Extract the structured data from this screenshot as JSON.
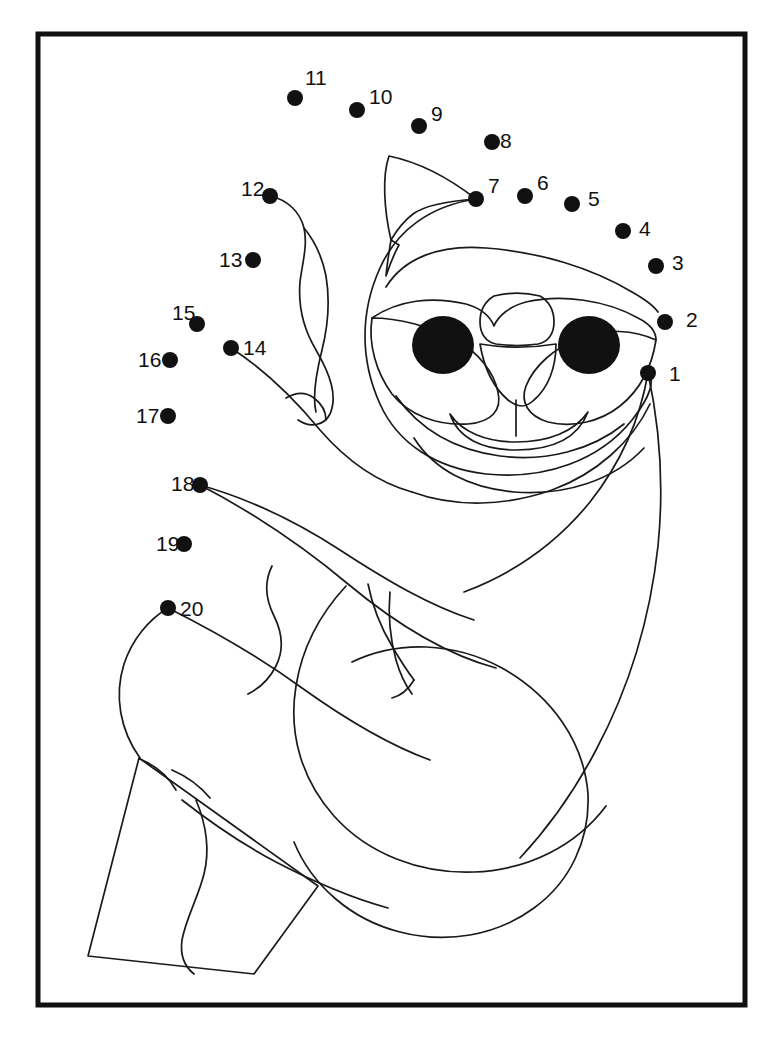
{
  "page": {
    "background_color": "#ffffff",
    "ink_color": "#111111",
    "width": 761,
    "height": 1059
  },
  "frame": {
    "name": "page-border",
    "x": 38,
    "y": 34,
    "width": 707,
    "height": 971,
    "stroke_color": "#111111",
    "stroke_width": 5
  },
  "puzzle": {
    "type": "dot-to-dot",
    "subject": "sloth hanging on a branch",
    "dot_count": 20,
    "dot_radius": 8,
    "label_font_size": 21,
    "dots": [
      {
        "number": "1",
        "x": 648,
        "y": 373,
        "label_x": 669,
        "label_y": 381
      },
      {
        "number": "2",
        "x": 665,
        "y": 322,
        "label_x": 686,
        "label_y": 327
      },
      {
        "number": "3",
        "x": 656,
        "y": 266,
        "label_x": 672,
        "label_y": 270
      },
      {
        "number": "4",
        "x": 623,
        "y": 231,
        "label_x": 639,
        "label_y": 236
      },
      {
        "number": "5",
        "x": 572,
        "y": 204,
        "label_x": 588,
        "label_y": 206
      },
      {
        "number": "6",
        "x": 525,
        "y": 196,
        "label_x": 537,
        "label_y": 190
      },
      {
        "number": "7",
        "x": 476,
        "y": 199,
        "label_x": 488,
        "label_y": 193
      },
      {
        "number": "8",
        "x": 492,
        "y": 142,
        "label_x": 500,
        "label_y": 148
      },
      {
        "number": "9",
        "x": 419,
        "y": 126,
        "label_x": 431,
        "label_y": 121
      },
      {
        "number": "10",
        "x": 357,
        "y": 110,
        "label_x": 369,
        "label_y": 104
      },
      {
        "number": "11",
        "x": 295,
        "y": 98,
        "label_x": 305,
        "label_y": 85
      },
      {
        "number": "12",
        "x": 270,
        "y": 196,
        "label_x": 241,
        "label_y": 196
      },
      {
        "number": "13",
        "x": 253,
        "y": 260,
        "label_x": 219,
        "label_y": 267
      },
      {
        "number": "14",
        "x": 231,
        "y": 348,
        "label_x": 243,
        "label_y": 355
      },
      {
        "number": "15",
        "x": 197,
        "y": 324,
        "label_x": 172,
        "label_y": 320
      },
      {
        "number": "16",
        "x": 170,
        "y": 360,
        "label_x": 138,
        "label_y": 367
      },
      {
        "number": "17",
        "x": 168,
        "y": 416,
        "label_x": 136,
        "label_y": 423
      },
      {
        "number": "18",
        "x": 200,
        "y": 485,
        "label_x": 171,
        "label_y": 491
      },
      {
        "number": "19",
        "x": 184,
        "y": 544,
        "label_x": 156,
        "label_y": 551
      },
      {
        "number": "20",
        "x": 168,
        "y": 608,
        "label_x": 180,
        "label_y": 616
      }
    ]
  },
  "artwork": {
    "description": "Line-art sloth hugging a tree branch",
    "parts": [
      {
        "name": "ear-left",
        "path": "M 389 156 C 382 176 384 210 391 240 C 398 228 405 220 413 214 C 424 206 448 201 476 199 C 449 178 418 162 389 156 Z"
      },
      {
        "name": "ear-inner-notch",
        "path": "M 391 240 C 389 252 387 264 386 276 C 390 264 394 254 399 245 Z"
      },
      {
        "name": "head-outer",
        "path": "M 476 199 C 430 206 397 230 380 268 C 360 312 360 360 380 404 C 398 444 436 468 486 474 C 546 480 600 460 632 420 C 651 396 655 380 648 373"
      },
      {
        "name": "brow-band",
        "path": "M 386 287 C 404 258 440 244 486 248 C 540 252 592 268 632 292 C 646 300 654 306 658 312"
      },
      {
        "name": "face-mask-top",
        "path": "M 372 318 C 398 300 432 296 466 304 C 480 308 490 316 494 326 C 498 316 510 306 526 302 C 562 294 606 300 638 318 C 650 324 656 332 656 340"
      },
      {
        "name": "face-mask-left",
        "path": "M 372 318 C 368 344 376 372 392 394 C 408 414 436 426 468 424 C 492 422 502 410 498 392 C 494 372 478 352 456 340 C 430 326 398 318 372 318 Z"
      },
      {
        "name": "face-mask-right",
        "path": "M 656 340 C 652 366 640 390 620 406 C 600 422 572 428 548 422 C 528 416 520 402 526 386 C 534 366 554 348 580 338 C 606 328 634 330 656 340 Z"
      },
      {
        "name": "nose-bridge",
        "path": "M 494 296 C 484 302 480 312 480 322 C 480 334 486 342 496 344 C 510 346 524 346 538 344 C 548 342 554 334 554 322 C 554 312 550 302 540 296 C 524 292 510 292 494 296 Z"
      },
      {
        "name": "nose-tip",
        "path": "M 480 344 C 484 368 494 388 508 400 C 518 408 526 408 534 400 C 548 388 556 368 556 344 C 532 348 504 348 480 344 Z"
      },
      {
        "name": "mouth-stem",
        "path": "M 516 400 L 516 436"
      },
      {
        "name": "mouth-curve",
        "path": "M 450 414 C 458 438 482 450 516 450 C 552 450 578 438 588 412 C 574 432 548 442 516 442 C 486 442 462 432 450 414 Z"
      },
      {
        "name": "cheek-line-left",
        "path": "M 396 396 C 420 430 456 450 500 456 C 546 462 592 450 624 424"
      },
      {
        "name": "chin-line",
        "path": "M 414 438 C 434 470 470 488 514 492 C 566 496 614 480 644 448"
      },
      {
        "name": "arm-upper-left",
        "path": "M 231 348 C 262 368 292 396 320 430 C 346 460 376 482 412 492"
      },
      {
        "name": "paw-left-crease",
        "path": "M 286 398 C 296 392 306 392 314 398 C 322 404 326 412 326 420"
      },
      {
        "name": "forearm-left",
        "path": "M 270 196 C 288 200 300 212 304 228 C 308 246 302 264 300 282 C 298 306 304 330 316 350 C 330 374 338 396 330 414 C 324 426 310 428 298 420"
      },
      {
        "name": "forearm-left-edge",
        "path": "M 304 228 C 314 240 322 256 326 276 C 330 300 328 326 322 350 C 316 374 312 396 316 412"
      },
      {
        "name": "belly-top",
        "path": "M 412 492 C 456 508 506 506 552 490 C 596 474 632 442 650 404"
      },
      {
        "name": "body-right-edge",
        "path": "M 648 373 C 660 428 664 486 658 546 C 650 620 628 690 596 750 C 574 792 548 828 520 858"
      },
      {
        "name": "body-inner-right",
        "path": "M 648 373 C 640 420 620 464 590 502 C 556 544 512 574 464 592"
      },
      {
        "name": "arm-lower",
        "path": "M 200 485 C 248 510 300 544 348 584 C 396 624 444 654 496 668"
      },
      {
        "name": "arm-lower-inner",
        "path": "M 200 485 C 246 498 294 520 340 550 C 386 580 430 606 474 620"
      },
      {
        "name": "claw-upper-1",
        "path": "M 368 584 C 372 604 380 626 392 646 C 400 660 408 672 414 680"
      },
      {
        "name": "claw-upper-2",
        "path": "M 390 592 C 388 614 390 638 396 660 C 400 674 406 686 412 694"
      },
      {
        "name": "claw-upper-3",
        "path": "M 414 680 C 408 690 400 696 392 698"
      },
      {
        "name": "fur-wave-upper",
        "path": "M 272 566 C 264 582 266 600 274 616 C 282 632 284 650 276 666 C 270 678 260 688 248 694"
      },
      {
        "name": "belly-lower",
        "path": "M 346 586 C 320 614 302 648 296 686 C 288 734 302 780 334 816 C 368 854 420 874 474 872 C 528 870 576 846 606 806"
      },
      {
        "name": "leg-lower-body",
        "path": "M 352 662 C 398 640 454 642 502 668 C 552 696 584 742 588 794 C 590 840 570 882 534 908 C 496 936 446 944 400 932 C 352 920 312 886 294 842"
      },
      {
        "name": "branch-outline",
        "path": "M 139 758 L 318 886 L 254 974 L 88 956 Z"
      },
      {
        "name": "branch-wave",
        "path": "M 196 800 C 206 824 210 850 204 874 C 198 898 186 918 182 940 C 180 954 184 966 194 974"
      },
      {
        "name": "branch-claw-notch",
        "path": "M 142 760 C 156 766 168 776 176 790"
      },
      {
        "name": "thigh-left",
        "path": "M 168 608 C 148 620 132 640 124 664 C 114 696 120 730 140 758"
      },
      {
        "name": "thigh-left-inner",
        "path": "M 168 608 C 212 630 258 656 302 688 C 344 718 386 744 430 760"
      },
      {
        "name": "foot-left-crease",
        "path": "M 172 770 C 186 776 200 786 210 798"
      },
      {
        "name": "foot-left-lower",
        "path": "M 182 800 C 210 822 242 844 276 862 C 314 882 352 898 388 908"
      }
    ]
  }
}
